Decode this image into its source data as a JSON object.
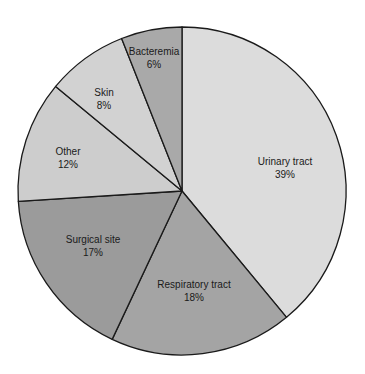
{
  "chart_data": {
    "type": "pie",
    "title": "",
    "start_angle_deg": 0,
    "direction": "clockwise",
    "center": [
      182,
      191
    ],
    "radius": 164,
    "slices": [
      {
        "label": "Urinary tract",
        "value": 39,
        "pct_label": "39%",
        "color": "#dcdcdc",
        "label_pos": [
          285,
          168
        ]
      },
      {
        "label": "Respiratory tract",
        "value": 18,
        "pct_label": "18%",
        "color": "#a4a4a4",
        "label_pos": [
          194,
          291
        ]
      },
      {
        "label": "Surgical site",
        "value": 17,
        "pct_label": "17%",
        "color": "#9b9b9b",
        "label_pos": [
          93,
          246
        ]
      },
      {
        "label": "Other",
        "value": 12,
        "pct_label": "12%",
        "color": "#cdcdcd",
        "label_pos": [
          68,
          158
        ]
      },
      {
        "label": "Skin",
        "value": 8,
        "pct_label": "8%",
        "color": "#d2d2d2",
        "label_pos": [
          104,
          99
        ]
      },
      {
        "label": "Bacteremia",
        "value": 6,
        "pct_label": "6%",
        "color": "#a9a9a9",
        "label_pos": [
          154,
          58
        ]
      }
    ],
    "legend": null
  }
}
